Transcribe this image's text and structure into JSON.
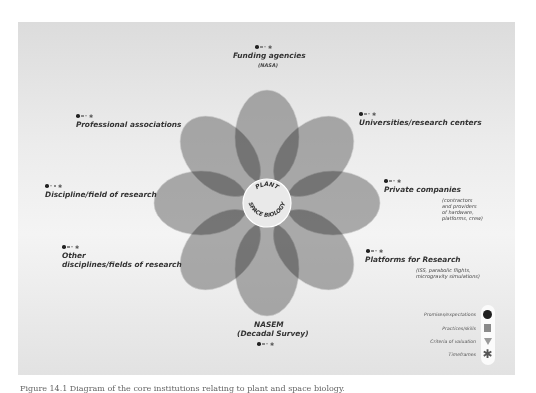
{
  "center_label": {
    "top": "PLANT",
    "bottom": "SPACE BIOLOGY"
  },
  "stakeholders": [
    {
      "id": "funding",
      "label": "Funding agencies",
      "sub": "(NASA)"
    },
    {
      "id": "universities",
      "label": "Universities/research centers",
      "sub": ""
    },
    {
      "id": "private",
      "label": "Private companies",
      "sub": [
        "(contractors",
        "and providers",
        "of hardware,",
        "platforms, crew)"
      ]
    },
    {
      "id": "platforms",
      "label": "Platforms for Research",
      "sub": [
        "(ISS, parabolic flights,",
        "microgravity simulations)"
      ]
    },
    {
      "id": "nasem",
      "label": "NASEM",
      "sub": "(Decadal Survey)"
    },
    {
      "id": "other",
      "label": [
        "Other",
        "disciplines/fields of research"
      ],
      "sub": ""
    },
    {
      "id": "discipline",
      "label": "Discipline/field of research",
      "sub": ""
    },
    {
      "id": "professional",
      "label": "Professional associations",
      "sub": ""
    }
  ],
  "legend": [
    {
      "icon": "circle-icon",
      "label": "Promises/expectations"
    },
    {
      "icon": "square-icon",
      "label": "Practices/skills"
    },
    {
      "icon": "triangle-icon",
      "label": "Criteria of valuation"
    },
    {
      "icon": "asterisk-icon",
      "label": "Timeframes"
    }
  ],
  "colors": {
    "petal": "#7a7a7a",
    "center": "#e8e8e8",
    "panel": "#e6e6e6"
  },
  "caption": "Figure 14.1 Diagram of the core institutions relating to plant and space biology."
}
